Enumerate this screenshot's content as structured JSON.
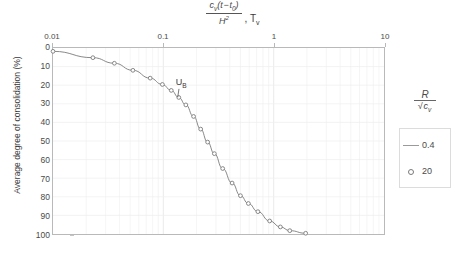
{
  "chart_data": {
    "type": "line",
    "title": "",
    "xlabel_parts": {
      "numerator": "c",
      "numerator_sub": "v",
      "numerator_rest": "(t − t",
      "numerator_sub2": "0",
      "numerator_close": ")",
      "denominator": "H",
      "denominator_sup": "2",
      "suffix": ", T",
      "suffix_sub": "v"
    },
    "xlabel": "c_v (t - t_0) / H^2 , T_v",
    "ylabel": "Average degree of consolidation (%)",
    "xscale": "log",
    "xlim": [
      0.01,
      10
    ],
    "ylim": [
      0,
      100
    ],
    "y_inverted": true,
    "xticks": [
      "0.01",
      "0.1",
      "1",
      "10"
    ],
    "xtick_values": [
      0.01,
      0.1,
      1,
      10
    ],
    "yticks": [
      "0",
      "10",
      "20",
      "30",
      "40",
      "50",
      "60",
      "70",
      "80",
      "90",
      "100"
    ],
    "ytick_values": [
      0,
      10,
      20,
      30,
      40,
      50,
      60,
      70,
      80,
      90,
      100
    ],
    "grid": true,
    "grid_minor": true,
    "legend_position": "right",
    "legend_title": "R / sqrt(c_v)",
    "legend_title_parts": {
      "numerator": "R",
      "denominator": "c",
      "denominator_sub": "v"
    },
    "legend_entries": [
      {
        "label": "0.4",
        "marker": "line",
        "color": "#9a9a9a"
      },
      {
        "label": "20",
        "marker": "circle",
        "color": "#7a7a7a"
      }
    ],
    "annotations": [
      {
        "text": "U",
        "sub": "B",
        "x": 0.115,
        "y": 22.5,
        "point_x": 0.135,
        "point_y": 26.5
      }
    ],
    "series": [
      {
        "name": "20",
        "marker": "circle",
        "color": "#7a7a7a",
        "points": [
          {
            "x": 0.01,
            "y": 1.8
          },
          {
            "x": 0.023,
            "y": 5.2
          },
          {
            "x": 0.036,
            "y": 8.2
          },
          {
            "x": 0.053,
            "y": 12.0
          },
          {
            "x": 0.076,
            "y": 16.2
          },
          {
            "x": 0.098,
            "y": 19.6
          },
          {
            "x": 0.118,
            "y": 22.8
          },
          {
            "x": 0.138,
            "y": 26.6
          },
          {
            "x": 0.16,
            "y": 30.6
          },
          {
            "x": 0.188,
            "y": 36.8
          },
          {
            "x": 0.218,
            "y": 43.6
          },
          {
            "x": 0.252,
            "y": 50.6
          },
          {
            "x": 0.29,
            "y": 56.8
          },
          {
            "x": 0.345,
            "y": 64.8
          },
          {
            "x": 0.42,
            "y": 72.6
          },
          {
            "x": 0.5,
            "y": 79.4
          },
          {
            "x": 0.59,
            "y": 83.6
          },
          {
            "x": 0.72,
            "y": 88.0
          },
          {
            "x": 0.92,
            "y": 93.0
          },
          {
            "x": 1.15,
            "y": 96.2
          },
          {
            "x": 1.4,
            "y": 98.2
          },
          {
            "x": 1.95,
            "y": 99.6
          }
        ]
      }
    ]
  }
}
